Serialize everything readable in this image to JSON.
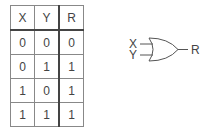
{
  "truth_table": {
    "headers": [
      "X",
      "Y",
      "R"
    ],
    "rows": [
      [
        "0",
        "0",
        "0"
      ],
      [
        "0",
        "1",
        "1"
      ],
      [
        "1",
        "0",
        "1"
      ],
      [
        "1",
        "1",
        "1"
      ]
    ]
  },
  "gate": {
    "type": "OR",
    "inputs": [
      "X",
      "Y"
    ],
    "output": "R"
  }
}
